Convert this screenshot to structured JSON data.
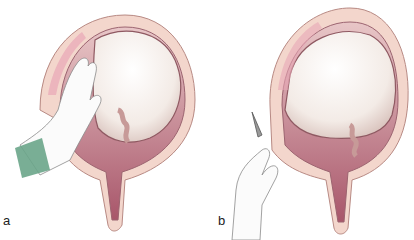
{
  "figure": {
    "panels": [
      {
        "label": "a",
        "description": "Manual pressure on uterine fundus with hand inside abdomen"
      },
      {
        "label": "b",
        "description": "Hand holding instrument at incision of lower uterine segment"
      }
    ]
  },
  "colors": {
    "uterus_wall": "#f3d6cc",
    "wall_outline": "#b88a84",
    "inner_fluid": "#b56a78",
    "sac": "#f7f2ee",
    "glove_cuff": "#6aa58a",
    "pink_dots": "#e8a7b6"
  }
}
